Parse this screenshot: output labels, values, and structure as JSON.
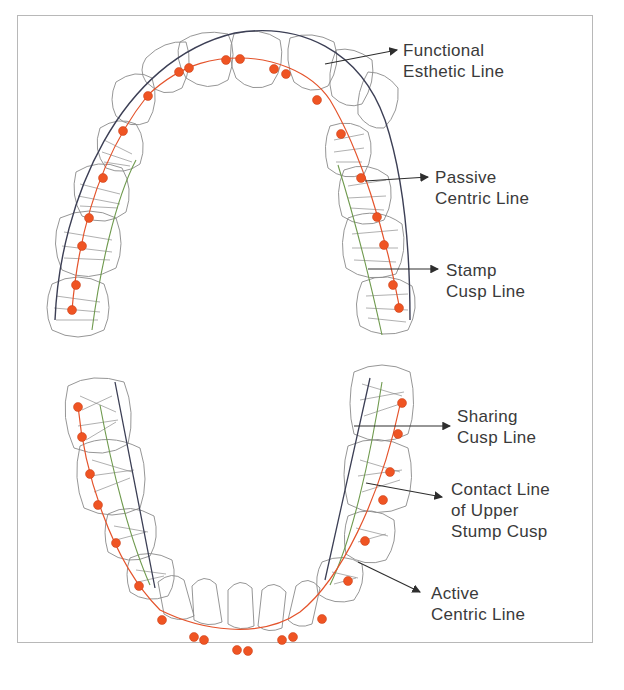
{
  "figure": {
    "colors": {
      "tooth_outline": "#8a8a8a",
      "functional_esthetic_line": "#3c3f55",
      "stamp_cusp_line": "#6f9a4e",
      "centric_line": "#e4532b",
      "contact_point": "#ef5423",
      "arrow": "#2e2e2e",
      "label_text": "#3a3a3a",
      "frame": "#b8b8b8"
    }
  },
  "upper_arch": {
    "labels": [
      {
        "id": "functional-esthetic-line",
        "line1": "Functional",
        "line2": "Esthetic Line"
      },
      {
        "id": "passive-centric-line",
        "line1": "Passive",
        "line2": "Centric Line"
      },
      {
        "id": "stamp-cusp-line",
        "line1": "Stamp",
        "line2": "Cusp Line"
      }
    ]
  },
  "lower_arch": {
    "labels": [
      {
        "id": "sharing-cusp-line",
        "line1": "Sharing",
        "line2": "Cusp Line"
      },
      {
        "id": "contact-line-upper-stump-cusp",
        "line1": "Contact Line",
        "line2": "of Upper",
        "line3": "Stump Cusp"
      },
      {
        "id": "active-centric-line",
        "line1": "Active",
        "line2": "Centric Line"
      }
    ]
  }
}
